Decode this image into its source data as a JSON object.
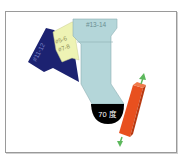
{
  "diagram": {
    "labels": {
      "dark_blue_tag": "#11-12",
      "yellow_tag_1": "#5-6",
      "yellow_tag_2": "#7-8",
      "light_blue_tag": "#13-14",
      "angle": "70 度"
    },
    "colors": {
      "dark_blue": "#1c2271",
      "yellow": "#eef3b4",
      "light_blue": "#b4d6d9",
      "angle_badge": "#000000",
      "orange_bar": "#e8501f",
      "arrow": "#5cb85c",
      "frame": "#9a9a9a"
    }
  }
}
